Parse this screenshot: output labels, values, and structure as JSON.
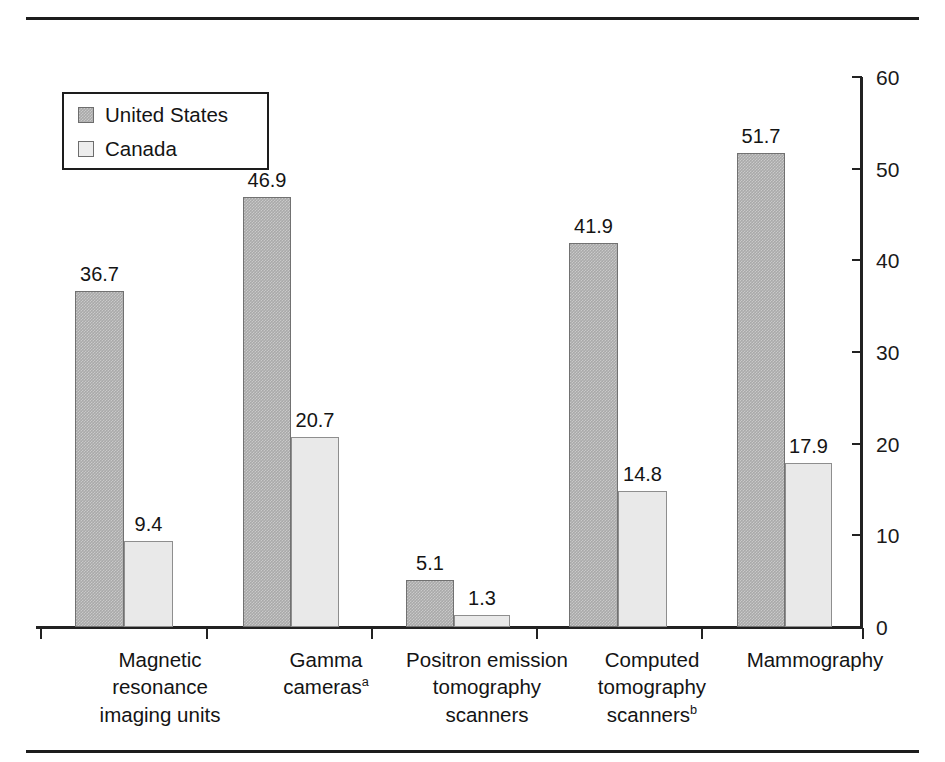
{
  "chart_data": {
    "type": "bar",
    "title": "",
    "subtitle": "",
    "xlabel": "",
    "ylabel": "",
    "ylim": [
      0,
      60
    ],
    "ytick_values": [
      0,
      10,
      20,
      30,
      40,
      50,
      60
    ],
    "ytick_labels": [
      "0",
      "10",
      "20",
      "30",
      "40",
      "50",
      "60"
    ],
    "y_axis_position": "right",
    "grid": false,
    "legend_position": "top-left",
    "categories": [
      "Magnetic\nresonance\nimaging units",
      "Gamma\ncameras",
      "Positron emission\ntomography\nscanners",
      "Computed\ntomography\nscanners",
      "Mammography"
    ],
    "category_footnotes": [
      "",
      "a",
      "",
      "b",
      ""
    ],
    "series": [
      {
        "name": "United States",
        "color": "#a9a9a9",
        "values": [
          36.7,
          46.9,
          5.1,
          41.9,
          51.7
        ],
        "labels": [
          "36.7",
          "46.9",
          "5.1",
          "41.9",
          "51.7"
        ]
      },
      {
        "name": "Canada",
        "color": "#e9e9e9",
        "values": [
          9.4,
          20.7,
          1.3,
          14.8,
          17.9
        ],
        "labels": [
          "9.4",
          "20.7",
          "1.3",
          "14.8",
          "17.9"
        ]
      }
    ]
  },
  "legend": {
    "items": [
      {
        "label": "United States",
        "swatch": "us"
      },
      {
        "label": "Canada",
        "swatch": "ca"
      }
    ]
  },
  "colors": {
    "united_states_bar": "#a9a9a9",
    "canada_bar": "#e9e9e9",
    "axis": "#222222",
    "rule": "#1d1d1d",
    "text": "#141414",
    "background": "#ffffff"
  }
}
